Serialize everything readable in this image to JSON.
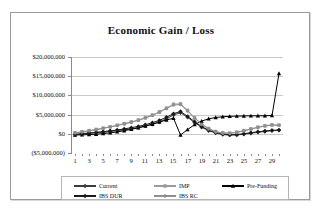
{
  "chart_data": {
    "type": "line",
    "title": "Economic Gain / Loss",
    "xlabel": "",
    "ylabel": "",
    "ylim": [
      -5000000,
      20000000
    ],
    "ytick_values": [
      20000000,
      15000000,
      10000000,
      5000000,
      0,
      -5000000
    ],
    "ytick_labels": [
      "$20,000,000",
      "$15,000,000",
      "$10,000,000",
      "$5,000,000",
      "$0",
      "($5,000,000)"
    ],
    "x": [
      1,
      2,
      3,
      4,
      5,
      6,
      7,
      8,
      9,
      10,
      11,
      12,
      13,
      14,
      15,
      16,
      17,
      18,
      19,
      20,
      21,
      22,
      23,
      24,
      25,
      26,
      27,
      28,
      29,
      30
    ],
    "xtick_labels": [
      "1",
      "3",
      "5",
      "7",
      "9",
      "11",
      "13",
      "15",
      "17",
      "19",
      "21",
      "23",
      "25",
      "27",
      "29"
    ],
    "grid": true,
    "legend_position": "bottom",
    "series": [
      {
        "name": "Current",
        "color": "#3c3c3c",
        "marker": "diamond",
        "values": [
          -200000,
          0,
          100000,
          250000,
          400000,
          600000,
          800000,
          1050000,
          1300000,
          1600000,
          2000000,
          2500000,
          3100000,
          3900000,
          4900000,
          5500000,
          4300000,
          2900000,
          1700000,
          800000,
          200000,
          -200000,
          -350000,
          -300000,
          -100000,
          150000,
          400000,
          600000,
          800000,
          900000
        ]
      },
      {
        "name": "IMP",
        "color": "#9a9a9a",
        "marker": "square",
        "values": [
          300000,
          550000,
          850000,
          1150000,
          1500000,
          1850000,
          2250000,
          2650000,
          3100000,
          3600000,
          4200000,
          4900000,
          5700000,
          6700000,
          7700000,
          7800000,
          6100000,
          4200000,
          2600000,
          1400000,
          600000,
          250000,
          200000,
          450000,
          850000,
          1300000,
          1750000,
          2100000,
          2350000,
          2300000
        ]
      },
      {
        "name": "Pre-Funding",
        "color": "#000000",
        "marker": "triangle",
        "values": [
          -300000,
          -250000,
          -200000,
          -100000,
          50000,
          250000,
          500000,
          800000,
          1150000,
          1550000,
          2000000,
          2500000,
          3050000,
          3600000,
          4050000,
          -300000,
          1100000,
          2400000,
          3300000,
          3900000,
          4250000,
          4450000,
          4550000,
          4600000,
          4650000,
          4680000,
          4700000,
          4720000,
          4750000,
          15700000
        ]
      },
      {
        "name": "IBS DUR",
        "color": "#1a1a1a",
        "marker": "diamond-filled",
        "values": [
          -150000,
          50000,
          200000,
          380000,
          560000,
          780000,
          1000000,
          1280000,
          1580000,
          1920000,
          2350000,
          2880000,
          3500000,
          4300000,
          5250000,
          5800000,
          4550000,
          3150000,
          1900000,
          950000,
          330000,
          -80000,
          -230000,
          -180000,
          20000,
          280000,
          530000,
          720000,
          900000,
          1000000
        ]
      },
      {
        "name": "IBS RC",
        "color": "#8f8f8f",
        "marker": "circle",
        "values": [
          200000,
          450000,
          750000,
          1050000,
          1400000,
          1750000,
          2150000,
          2550000,
          3000000,
          3500000,
          4100000,
          4800000,
          5600000,
          6550000,
          7500000,
          7600000,
          5950000,
          4050000,
          2450000,
          1250000,
          480000,
          130000,
          90000,
          340000,
          740000,
          1200000,
          1650000,
          2000000,
          2250000,
          2200000
        ]
      }
    ]
  }
}
